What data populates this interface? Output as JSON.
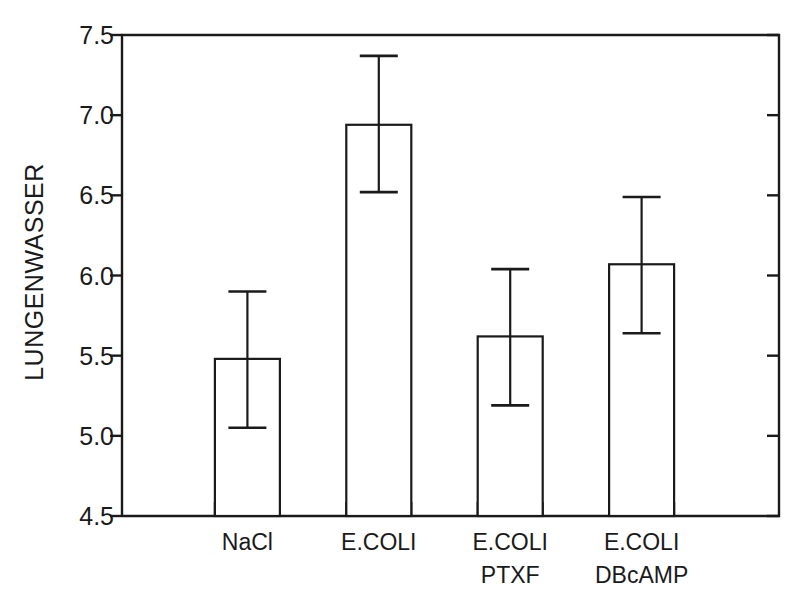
{
  "chart_data": {
    "type": "bar",
    "title": "",
    "xlabel": "",
    "ylabel": "LUNGENWASSER",
    "categories": [
      "NaCl",
      "E.COLI",
      "E.COLI PTXF",
      "E.COLI DBcAMP"
    ],
    "category_lines": [
      [
        "NaCl",
        ""
      ],
      [
        "E.COLI",
        ""
      ],
      [
        "E.COLI",
        "PTXF"
      ],
      [
        "E.COLI",
        "DBcAMP"
      ]
    ],
    "values": [
      5.48,
      6.94,
      5.62,
      6.07
    ],
    "error_low": [
      5.05,
      6.52,
      5.19,
      5.64
    ],
    "error_high": [
      5.9,
      7.37,
      6.04,
      6.49
    ],
    "errors": [
      0.43,
      0.43,
      0.43,
      0.43
    ],
    "ylim": [
      4.5,
      7.5
    ],
    "yticks": [
      4.5,
      5.0,
      5.5,
      6.0,
      6.5,
      7.0,
      7.5
    ],
    "ytick_labels": [
      "4.5",
      "5.0",
      "5.5",
      "6.0",
      "6.5",
      "7.0",
      "7.5"
    ],
    "grid": false,
    "legend": null,
    "bar_facecolor": "#ffffff",
    "bar_edgecolor": "#1a1a1a",
    "axis_color": "#1a1a1a",
    "background": "#ffffff"
  }
}
